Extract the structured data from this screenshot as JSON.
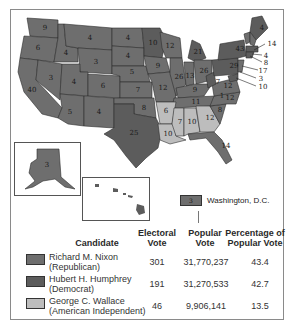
{
  "map": {
    "title": "1968 Presidential Election",
    "state_labels": [
      {
        "state": "WA",
        "ev": "9",
        "party": "rep"
      },
      {
        "state": "OR",
        "ev": "6",
        "party": "rep"
      },
      {
        "state": "CA",
        "ev": "40",
        "party": "rep"
      },
      {
        "state": "NV",
        "ev": "3",
        "party": "rep"
      },
      {
        "state": "ID",
        "ev": "4",
        "party": "rep"
      },
      {
        "state": "MT",
        "ev": "4",
        "party": "rep"
      },
      {
        "state": "WY",
        "ev": "3",
        "party": "rep"
      },
      {
        "state": "UT",
        "ev": "4",
        "party": "rep"
      },
      {
        "state": "CO",
        "ev": "6",
        "party": "rep"
      },
      {
        "state": "AZ",
        "ev": "5",
        "party": "rep"
      },
      {
        "state": "NM",
        "ev": "4",
        "party": "rep"
      },
      {
        "state": "ND",
        "ev": "4",
        "party": "rep"
      },
      {
        "state": "SD",
        "ev": "4",
        "party": "rep"
      },
      {
        "state": "NE",
        "ev": "5",
        "party": "rep"
      },
      {
        "state": "KS",
        "ev": "7",
        "party": "rep"
      },
      {
        "state": "OK",
        "ev": "8",
        "party": "rep"
      },
      {
        "state": "TX",
        "ev": "25",
        "party": "dem"
      },
      {
        "state": "MN",
        "ev": "10",
        "party": "dem"
      },
      {
        "state": "IA",
        "ev": "9",
        "party": "rep"
      },
      {
        "state": "MO",
        "ev": "12",
        "party": "rep"
      },
      {
        "state": "AR",
        "ev": "6",
        "party": "aip"
      },
      {
        "state": "LA",
        "ev": "10",
        "party": "aip"
      },
      {
        "state": "WI",
        "ev": "12",
        "party": "rep"
      },
      {
        "state": "IL",
        "ev": "26",
        "party": "rep"
      },
      {
        "state": "MI",
        "ev": "21",
        "party": "dem"
      },
      {
        "state": "IN",
        "ev": "13",
        "party": "rep"
      },
      {
        "state": "OH",
        "ev": "26",
        "party": "rep"
      },
      {
        "state": "KY",
        "ev": "9",
        "party": "rep"
      },
      {
        "state": "TN",
        "ev": "11",
        "party": "rep"
      },
      {
        "state": "MS",
        "ev": "7",
        "party": "aip"
      },
      {
        "state": "AL",
        "ev": "10",
        "party": "aip"
      },
      {
        "state": "GA",
        "ev": "12",
        "party": "aip"
      },
      {
        "state": "FL",
        "ev": "14",
        "party": "rep"
      },
      {
        "state": "SC",
        "ev": "8",
        "party": "rep"
      },
      {
        "state": "NC",
        "ev": "12",
        "party": "rep"
      },
      {
        "state": "NC-faithless",
        "ev": "1",
        "party": "aip"
      },
      {
        "state": "VA",
        "ev": "12",
        "party": "rep"
      },
      {
        "state": "WV",
        "ev": "7",
        "party": "dem"
      },
      {
        "state": "PA",
        "ev": "29",
        "party": "dem"
      },
      {
        "state": "NY",
        "ev": "43",
        "party": "dem"
      },
      {
        "state": "ME",
        "ev": "4",
        "party": "dem"
      },
      {
        "state": "VT",
        "ev": "3",
        "party": "rep"
      },
      {
        "state": "NH",
        "ev": "4",
        "party": "rep"
      },
      {
        "state": "MA",
        "ev": "14",
        "party": "dem"
      },
      {
        "state": "RI",
        "ev": "4",
        "party": "dem"
      },
      {
        "state": "CT",
        "ev": "8",
        "party": "dem"
      },
      {
        "state": "NJ",
        "ev": "17",
        "party": "rep"
      },
      {
        "state": "DE",
        "ev": "3",
        "party": "rep"
      },
      {
        "state": "MD",
        "ev": "10",
        "party": "dem"
      },
      {
        "state": "AK",
        "ev": "3",
        "party": "rep"
      },
      {
        "state": "HI",
        "ev": "4",
        "party": "dem"
      }
    ],
    "callouts": [
      "14",
      "4",
      "8",
      "17",
      "3",
      "10"
    ],
    "dc": {
      "ev": "3",
      "label": "Washington, D.C."
    }
  },
  "legend": {
    "headers": {
      "candidate": "Candidate",
      "electoral": [
        "Electoral",
        "Vote"
      ],
      "popular": [
        "Popular",
        "Vote"
      ],
      "percentage": [
        "Percentage of",
        "Popular Vote"
      ]
    },
    "rows": [
      {
        "name": "Richard M. Nixon",
        "party": "(Republican)",
        "electoral": "301",
        "popular": "31,770,237",
        "percent": "43.4",
        "color": "#6e6e6e"
      },
      {
        "name": "Hubert H. Humphrey",
        "party": "(Democrat)",
        "electoral": "191",
        "popular": "31,270,533",
        "percent": "42.7",
        "color": "#5c5c5c"
      },
      {
        "name": "George C. Wallace",
        "party": "(American Independent)",
        "electoral": "46",
        "popular": "9,906,141",
        "percent": "13.5",
        "color": "#bdbdbd"
      }
    ]
  }
}
